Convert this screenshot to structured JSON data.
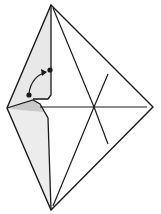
{
  "diagram": {
    "type": "origami-fold-step",
    "colors": {
      "line": "#1a1a1a",
      "shade_light": "#e6e6e6",
      "shade_dark": "#c8c8c8",
      "background": "#ffffff"
    },
    "vertices": {
      "top": [
        51,
        5
      ],
      "left": [
        7,
        108
      ],
      "right": [
        153,
        107
      ],
      "bottom": [
        51,
        210
      ],
      "center": [
        94,
        107
      ]
    },
    "markers": [
      {
        "name": "start-dot",
        "x": 29,
        "y": 95
      },
      {
        "name": "end-dot",
        "x": 50,
        "y": 70
      }
    ],
    "arrow": {
      "from": [
        29,
        95
      ],
      "to": [
        48,
        72
      ],
      "label": "fold direction"
    }
  }
}
